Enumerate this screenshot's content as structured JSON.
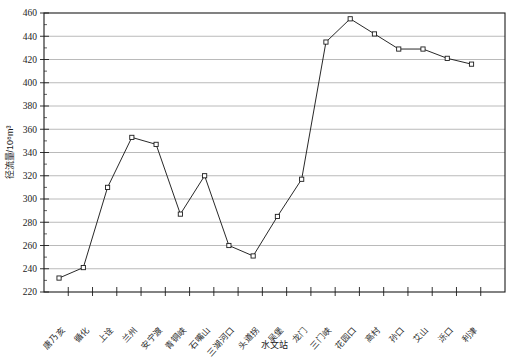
{
  "chart_data": {
    "type": "line",
    "title": "",
    "xlabel": "水文站",
    "ylabel": "径流量/10⁸m³",
    "ylim": [
      220,
      460
    ],
    "ytick_step": 20,
    "yticks": [
      220,
      240,
      260,
      280,
      300,
      320,
      340,
      360,
      380,
      400,
      420,
      440,
      460
    ],
    "ytick_labels": [
      "220",
      "240",
      "260",
      "280",
      "300",
      "320",
      "340",
      "360",
      "380",
      "400",
      "420",
      "440",
      "460"
    ],
    "grid": "horizontal",
    "legend": "none",
    "marker": "open-square",
    "categories": [
      "唐乃亥",
      "循化",
      "上诠",
      "兰州",
      "安宁渡",
      "青铜峡",
      "石嘴山",
      "三湖河口",
      "头道拐",
      "吴堡",
      "龙门",
      "三门峡",
      "花园口",
      "高村",
      "孙口",
      "艾山",
      "泺口",
      "利津"
    ],
    "values": [
      232,
      241,
      310,
      353,
      347,
      287,
      320,
      260,
      251,
      285,
      317,
      435,
      455,
      442,
      429,
      429,
      421,
      416
    ],
    "series": [
      {
        "name": "径流量",
        "values": [
          232,
          241,
          310,
          353,
          347,
          287,
          320,
          260,
          251,
          285,
          317,
          435,
          455,
          442,
          429,
          429,
          421,
          416
        ]
      }
    ],
    "points": [
      {
        "station": "唐乃亥",
        "value": 232
      },
      {
        "station": "循化",
        "value": 241
      },
      {
        "station": "上诠",
        "value": 310
      },
      {
        "station": "兰州",
        "value": 353
      },
      {
        "station": "安宁渡",
        "value": 347
      },
      {
        "station": "青铜峡",
        "value": 287
      },
      {
        "station": "石嘴山",
        "value": 320
      },
      {
        "station": "三湖河口",
        "value": 260
      },
      {
        "station": "头道拐",
        "value": 251
      },
      {
        "station": "吴堡",
        "value": 285
      },
      {
        "station": "龙门",
        "value": 317
      },
      {
        "station": "三门峡",
        "value": 435
      },
      {
        "station": "花园口",
        "value": 455
      },
      {
        "station": "高村",
        "value": 442
      },
      {
        "station": "孙口",
        "value": 429
      },
      {
        "station": "艾山",
        "value": 429
      },
      {
        "station": "泺口",
        "value": 421
      },
      {
        "station": "利津",
        "value": 416
      }
    ]
  },
  "colors": {
    "line": "#1c1c1c",
    "grid": "#a8a8a8",
    "frame": "#1c1c1c",
    "marker_fill": "#ffffff",
    "background": "#ffffff"
  }
}
